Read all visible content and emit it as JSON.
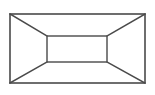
{
  "figure": {
    "canvas": {
      "width": 155,
      "height": 95,
      "background_color": "#ffffff"
    },
    "style": {
      "stroke_color": "#4a4a4a",
      "stroke_color_inner": "#555555",
      "stroke_width_outer": 1.6,
      "stroke_width_inner": 1.5,
      "stroke_width_diagonal": 1.5,
      "fill": "none"
    }
  },
  "chart_data": {
    "type": "diagram",
    "shapes": [
      {
        "name": "outer-rectangle",
        "role": "front opening",
        "x": 10,
        "y": 14,
        "width": 135,
        "height": 69,
        "corners": {
          "top_left": [
            10,
            14
          ],
          "top_right": [
            145,
            14
          ],
          "bottom_right": [
            145,
            83
          ],
          "bottom_left": [
            10,
            83
          ]
        }
      },
      {
        "name": "inner-rectangle",
        "role": "back wall",
        "x": 47,
        "y": 36,
        "width": 60,
        "height": 26,
        "corners": {
          "top_left": [
            47,
            36
          ],
          "top_right": [
            107,
            36
          ],
          "bottom_right": [
            107,
            62
          ],
          "bottom_left": [
            47,
            62
          ]
        }
      }
    ],
    "diagonals": [
      {
        "name": "diagonal-top-left",
        "role": "ceiling-left edge",
        "from": [
          10,
          14
        ],
        "to": [
          47,
          36
        ]
      },
      {
        "name": "diagonal-top-right",
        "role": "ceiling-right edge",
        "from": [
          145,
          14
        ],
        "to": [
          107,
          36
        ]
      },
      {
        "name": "diagonal-bottom-right",
        "role": "floor-right edge",
        "from": [
          145,
          83
        ],
        "to": [
          107,
          62
        ]
      },
      {
        "name": "diagonal-bottom-left",
        "role": "floor-left edge",
        "from": [
          10,
          83
        ],
        "to": [
          47,
          62
        ]
      }
    ],
    "regions": [
      {
        "name": "ceiling-plane",
        "points": "10,14 145,14 107,36 47,36"
      },
      {
        "name": "right-wall-plane",
        "points": "145,14 145,83 107,62 107,36"
      },
      {
        "name": "floor-plane",
        "points": "10,83 145,83 107,62 47,62"
      },
      {
        "name": "left-wall-plane",
        "points": "10,14 47,36 47,62 10,83"
      },
      {
        "name": "back-wall-plane",
        "points": "47,36 107,36 107,62 47,62"
      }
    ],
    "vanishing_point": [
      77,
      49
    ],
    "labels": [],
    "legend": [],
    "grid": false
  }
}
